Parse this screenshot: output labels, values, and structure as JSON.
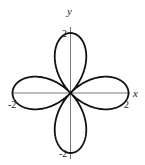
{
  "chart_data": {
    "type": "line",
    "title": "",
    "equation": "r = 2cos(2θ)",
    "xlabel": "x",
    "ylabel": "y",
    "xlim": [
      -2,
      2
    ],
    "ylim": [
      -2,
      2
    ],
    "grid": false,
    "legend": null,
    "tick_labels": {
      "x_left": "-2",
      "x_right": "2",
      "y_top": "2",
      "y_bottom": "-2"
    },
    "series": [
      {
        "name": "rose",
        "petals": 4,
        "petal_tips": [
          [
            2,
            0
          ],
          [
            0,
            2
          ],
          [
            -2,
            0
          ],
          [
            0,
            -2
          ]
        ],
        "color": "#111111"
      }
    ]
  },
  "axes": {
    "x_label": "x",
    "y_label": "y",
    "x_min_label": "-2",
    "x_max_label": "2",
    "y_max_label": "2",
    "y_min_label": "-2"
  }
}
